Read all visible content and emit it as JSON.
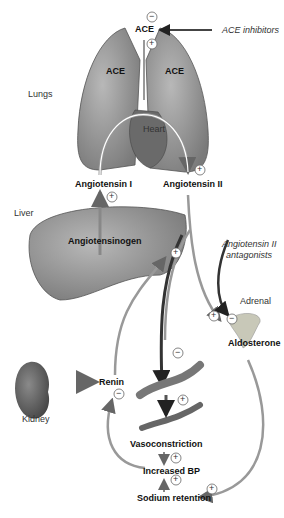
{
  "diagram": {
    "organs": {
      "lungs": "Lungs",
      "heart": "Heart",
      "liver": "Liver",
      "kidney": "Kidney",
      "adrenal": "Adrenal"
    },
    "enzymes": {
      "ace_top": "ACE",
      "ace_left": "ACE",
      "ace_right": "ACE",
      "renin": "Renin"
    },
    "molecules": {
      "angiotensin_1": "Angiotensin I",
      "angiotensin_2": "Angiotensin II",
      "angiotensinogen": "Angiotensinogen",
      "aldosterone": "Aldosterone"
    },
    "drugs": {
      "ace_inhibitors": "ACE inhibitors",
      "at2_antagonists_line1": "Angiotensin II",
      "at2_antagonists_line2": "antagonists"
    },
    "effects": {
      "vasoconstriction": "Vasoconstriction",
      "increased_bp": "Increased BP",
      "sodium_retention": "Sodium retention"
    },
    "signs": {
      "plus": "+",
      "minus": "−"
    },
    "colors": {
      "organ_fill": "#9a9a9a",
      "organ_dark": "#6e6e6e",
      "arrow": "#777777",
      "arrow_dark": "#333333",
      "text": "#111111"
    }
  }
}
